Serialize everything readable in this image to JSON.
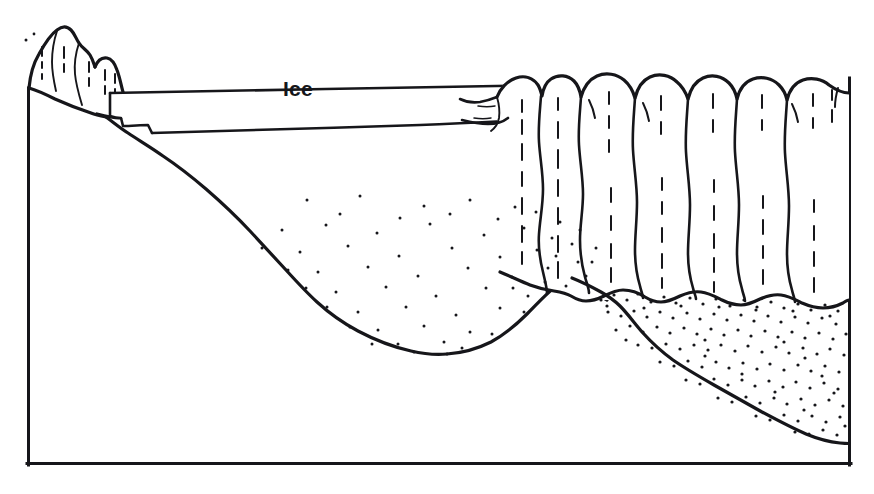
{
  "figure": {
    "kind": "geological-cross-section",
    "title": "",
    "caption": "",
    "background_color": "#ffffff",
    "ink_color": "#16161a"
  },
  "labels": [
    {
      "id": "ice",
      "text": "Ice",
      "x": 283,
      "y": 96,
      "font_size_px": 21,
      "bold": true
    }
  ],
  "features": {
    "frame": {
      "name": "section-box",
      "left_x": 27,
      "right_x": 851,
      "top_left_y": 88,
      "top_right_y": 78,
      "bottom_y": 465
    },
    "ice_layer": {
      "name": "glacier-ice-tongue",
      "label": "Ice",
      "left_tip_x": 110,
      "right_end_x": 520,
      "top_y_left": 93,
      "top_y_right": 86,
      "bottom_y_left": 134,
      "bottom_y_right": 120
    },
    "left_cliff": {
      "name": "left-rock-outcrop",
      "description": "lobed eroded rock knobs above left rim",
      "lobe_count": 3
    },
    "columnar_cliff": {
      "name": "columnar-basalt-cliff",
      "description": "rounded-top jointed rock columns on the right side",
      "column_count": 7,
      "top_y": 74,
      "base_y": 290
    },
    "basin_fill": {
      "name": "sparse-sediment-basin",
      "description": "sparsely stippled sediment filling the scoured basin",
      "stipple_density": "sparse"
    },
    "right_deposit": {
      "name": "dense-sediment-wedge",
      "description": "densely stippled talus / till wedge banked against the columns",
      "stipple_density": "dense"
    }
  },
  "colors": {
    "ink": "#16161a",
    "paper": "#ffffff"
  }
}
